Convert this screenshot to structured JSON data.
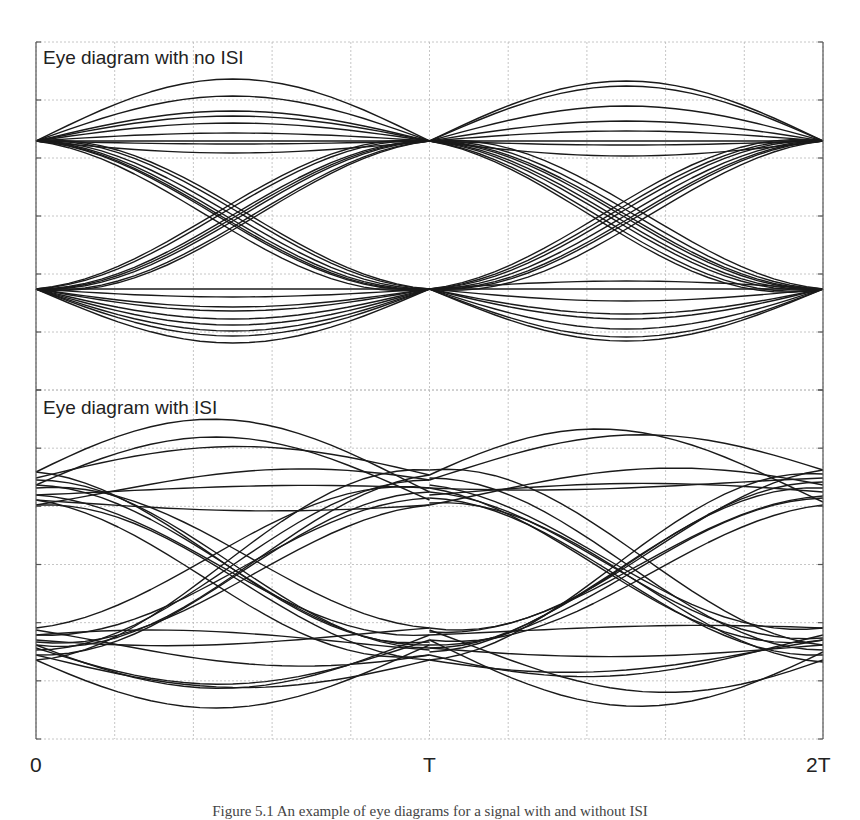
{
  "figure": {
    "caption_partial": "Figure 5.1  An example of eye diagrams for a signal with and without ISI"
  },
  "chart_data": [
    {
      "type": "line",
      "title": "Eye diagram with no ISI",
      "xlabel": "",
      "ylabel": "",
      "x_ticks": [
        "0",
        "T",
        "2T"
      ],
      "grid": true,
      "xlim": [
        0,
        2
      ],
      "ylim": [
        -1.2,
        1.2
      ],
      "levels": {
        "high": 0.63,
        "low": -0.63
      },
      "description": "Traces converge exactly to two levels at t=0, T, 2T; curves bulge between sample points; wide open eye",
      "series": [
        {
          "name": "segment 0-T",
          "transitions": [
            "high-high",
            "high-low",
            "low-high",
            "low-low"
          ],
          "approx_trace_count": 28
        },
        {
          "name": "segment T-2T",
          "transitions": [
            "high-high",
            "high-low",
            "low-high",
            "low-low"
          ],
          "approx_trace_count": 28
        }
      ],
      "extents": {
        "max_overshoot": 1.0,
        "min_undershoot": -0.93
      }
    },
    {
      "type": "line",
      "title": "Eye diagram with ISI",
      "xlabel": "",
      "ylabel": "",
      "x_ticks": [
        "0",
        "T",
        "2T"
      ],
      "grid": true,
      "xlim": [
        0,
        2
      ],
      "ylim": [
        -1.2,
        1.2
      ],
      "levels": {
        "high_band": [
          0.55,
          0.8
        ],
        "low_band": [
          -0.85,
          -0.55
        ]
      },
      "description": "Traces do not converge to single points at sampling instants; rails smeared into bands; eye partially closed",
      "series": [
        {
          "name": "segment 0-T",
          "transitions": [
            "high-high",
            "high-low",
            "low-high",
            "low-low"
          ],
          "approx_trace_count": 30
        },
        {
          "name": "segment T-2T",
          "transitions": [
            "high-high",
            "high-low",
            "low-high",
            "low-low"
          ],
          "approx_trace_count": 30
        }
      ],
      "extents": {
        "max_overshoot": 1.05,
        "min_undershoot": -1.05
      }
    }
  ],
  "panels": [
    {
      "title": "Eye diagram with no ISI"
    },
    {
      "title": "Eye diagram with ISI"
    }
  ],
  "axis": {
    "ticks": [
      "0",
      "T",
      "2T"
    ]
  },
  "colors": {
    "trace": "#1a1a1a",
    "grid": "#b8b8b8",
    "frame": "#555555"
  },
  "render": {
    "frame": {
      "x0": 36,
      "x1": 823
    },
    "panels": [
      {
        "y0": 42,
        "y1": 390,
        "hi": 141,
        "lo": 289,
        "isi": false,
        "seg1": {
          "hh": [
            0,
            -18,
            -30,
            -45,
            -62,
            -8,
            3,
            12,
            -25
          ],
          "ll": [
            0,
            18,
            30,
            42,
            54,
            8,
            22,
            47,
            36
          ],
          "hl": [
            0,
            5,
            -6,
            10,
            -10,
            16,
            8
          ],
          "lh": [
            0,
            6,
            -8,
            12,
            -12,
            3,
            15
          ]
        },
        "seg2": {
          "hh": [
            0,
            -20,
            -35,
            -55,
            -60,
            -10,
            4,
            15
          ],
          "ll": [
            0,
            12,
            25,
            40,
            48,
            52,
            -8,
            30
          ],
          "hl": [
            0,
            8,
            -5,
            12,
            -12,
            18,
            3,
            22
          ],
          "lh": [
            0,
            -6,
            8,
            -10,
            14,
            5,
            -15
          ]
        }
      },
      {
        "y0": 390,
        "y1": 739,
        "hi": 490,
        "lo": 645,
        "isi": true,
        "seg1": {
          "hh": [
            [
              478,
              475,
              -30
            ],
            [
              495,
              488,
              -5
            ],
            [
              485,
              500,
              -55
            ],
            [
              505,
              480,
              -20
            ],
            [
              472,
              492,
              -62
            ],
            [
              500,
              505,
              8
            ]
          ],
          "ll": [
            [
              648,
              640,
              40
            ],
            [
              630,
              655,
              20
            ],
            [
              660,
              645,
              55
            ],
            [
              640,
              628,
              10
            ],
            [
              655,
              660,
              30
            ],
            [
              635,
              650,
              -10
            ],
            [
              645,
              635,
              48
            ]
          ],
          "hl": [
            [
              480,
              648,
              0
            ],
            [
              495,
              635,
              8
            ],
            [
              505,
              660,
              -6
            ],
            [
              472,
              642,
              12
            ],
            [
              488,
              628,
              -10
            ],
            [
              500,
              655,
              18
            ],
            [
              485,
              645,
              4
            ]
          ],
          "lh": [
            [
              650,
              480,
              0
            ],
            [
              635,
              498,
              6
            ],
            [
              660,
              470,
              -8
            ],
            [
              642,
              505,
              12
            ],
            [
              628,
              488,
              -14
            ],
            [
              655,
              492,
              4
            ],
            [
              645,
              475,
              16
            ]
          ]
        },
        "seg2": {
          "hh": [
            [
              480,
              470,
              -40
            ],
            [
              495,
              492,
              -10
            ],
            [
              475,
              502,
              -58
            ],
            [
              505,
              485,
              -25
            ],
            [
              488,
              478,
              5
            ]
          ],
          "ll": [
            [
              640,
              652,
              60
            ],
            [
              655,
              635,
              30
            ],
            [
              630,
              660,
              45
            ],
            [
              648,
              645,
              10
            ],
            [
              660,
              640,
              20
            ],
            [
              635,
              628,
              -5
            ]
          ],
          "hl": [
            [
              478,
              650,
              0
            ],
            [
              492,
              638,
              10
            ],
            [
              503,
              662,
              -8
            ],
            [
              485,
              628,
              14
            ],
            [
              470,
              645,
              -12
            ],
            [
              498,
              655,
              5
            ],
            [
              488,
              640,
              20
            ]
          ],
          "lh": [
            [
              648,
              482,
              0
            ],
            [
              632,
              496,
              8
            ],
            [
              660,
              474,
              -10
            ],
            [
              640,
              505,
              14
            ],
            [
              652,
              488,
              -6
            ],
            [
              628,
              470,
              18
            ],
            [
              645,
              498,
              4
            ]
          ]
        }
      }
    ]
  }
}
